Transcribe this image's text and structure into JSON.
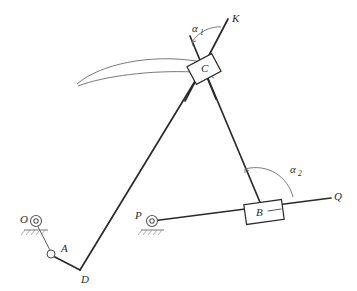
{
  "diagram": {
    "background_color": "#ffffff",
    "line_color": "#2a2a2a",
    "accent_color": "#6b6b6b",
    "width": 357,
    "height": 291,
    "labels": {
      "O": "O",
      "A": "A",
      "D": "D",
      "C": "C",
      "K": "K",
      "B": "B",
      "P": "P",
      "Q": "Q",
      "alpha1_base": "α",
      "alpha1_sub": "1",
      "alpha2_base": "α",
      "alpha2_sub": "2"
    },
    "points": {
      "O": {
        "x": 33,
        "y": 220
      },
      "A": {
        "x": 51,
        "y": 255
      },
      "D": {
        "x": 80,
        "y": 270
      },
      "C": {
        "x": 204,
        "y": 69
      },
      "K": {
        "x": 230,
        "y": 16
      },
      "B": {
        "x": 264,
        "y": 212
      },
      "P": {
        "x": 150,
        "y": 222
      },
      "Q": {
        "x": 330,
        "y": 198
      }
    },
    "members": [
      {
        "name": "crank-OA",
        "from": "O",
        "to": "A",
        "style": "thin"
      },
      {
        "name": "link-AD",
        "from": "A",
        "to": "D",
        "style": "main"
      },
      {
        "name": "link-DC",
        "from": "D",
        "to": "C",
        "style": "main"
      },
      {
        "name": "link-CB",
        "from": "C",
        "to": "B",
        "style": "main"
      },
      {
        "name": "guide-line-PQ",
        "from": "P",
        "to": "Q",
        "style": "main"
      },
      {
        "name": "guide-line-K",
        "from": "C",
        "to": "K",
        "style": "main"
      }
    ],
    "sliders": [
      {
        "name": "slider-block-C",
        "at": "C",
        "rotation_deg": -28
      },
      {
        "name": "slider-block-B",
        "at": "B",
        "rotation_deg": -8
      }
    ],
    "supports": [
      {
        "name": "fixed-pivot-O",
        "at": "O"
      },
      {
        "name": "fixed-pivot-P",
        "at": "P"
      }
    ],
    "angles": [
      {
        "name": "angle-alpha-1",
        "vertex": "C",
        "label": "α₁"
      },
      {
        "name": "angle-alpha-2",
        "vertex": "B",
        "label": "α₂"
      }
    ]
  }
}
